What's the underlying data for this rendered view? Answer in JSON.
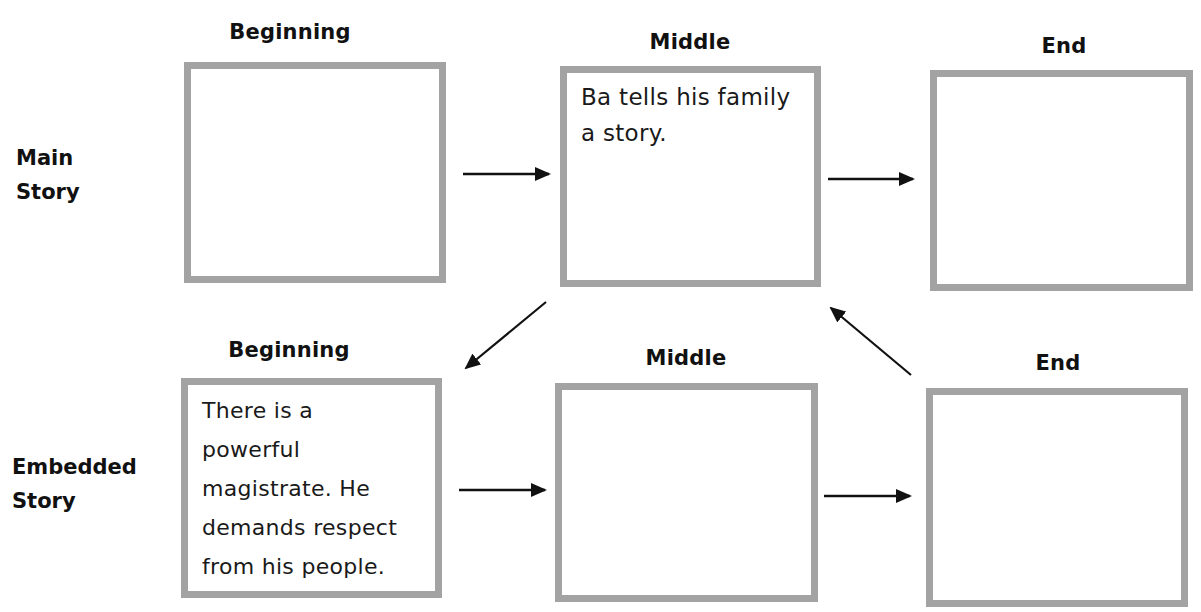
{
  "diagram": {
    "rows": [
      {
        "label": "Main\nStory",
        "label_lines": [
          "Main",
          "Story"
        ],
        "boxes": [
          {
            "heading": "Beginning",
            "text": ""
          },
          {
            "heading": "Middle",
            "text": "Ba tells his family\na story."
          },
          {
            "heading": "End",
            "text": ""
          }
        ]
      },
      {
        "label": "Embedded\nStory",
        "label_lines": [
          "Embedded",
          "Story"
        ],
        "boxes": [
          {
            "heading": "Beginning",
            "text": "There is a\npowerful\nmagistrate. He\ndemands respect\nfrom his people."
          },
          {
            "heading": "Middle",
            "text": ""
          },
          {
            "heading": "End",
            "text": ""
          }
        ]
      }
    ],
    "arrows": [
      {
        "from": "main-beginning",
        "to": "main-middle",
        "direction": "right"
      },
      {
        "from": "main-middle",
        "to": "main-end",
        "direction": "right"
      },
      {
        "from": "main-middle",
        "to": "embedded-beginning",
        "direction": "down-left"
      },
      {
        "from": "embedded-beginning",
        "to": "embedded-middle",
        "direction": "right"
      },
      {
        "from": "embedded-middle",
        "to": "embedded-end",
        "direction": "right"
      },
      {
        "from": "embedded-end",
        "to": "main-middle",
        "direction": "up-left"
      }
    ],
    "colors": {
      "box_border": "#a3a3a3",
      "text": "#111111",
      "arrow": "#111111"
    }
  }
}
